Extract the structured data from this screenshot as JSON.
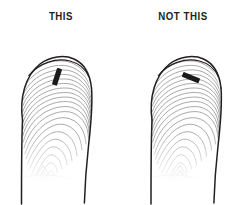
{
  "illustration": {
    "kind": "fingerprint-instruction-diagram",
    "subject": "fingertip with ink mark placement",
    "background_color": "#ffffff",
    "outline_color": "#231f20",
    "ridge_color": "#8c8c8c",
    "mark_color": "#1a1a1a",
    "label_color": "#231f20"
  },
  "panels": [
    {
      "id": "good",
      "label": "THIS",
      "is_correct": true,
      "mark": {
        "name": "ink-mark",
        "orientation": "near-vertical",
        "angle_degrees": 18,
        "position": "upper-right of fingertip pad",
        "length_px": 17,
        "width_px": 5,
        "color": "#1a1a1a"
      },
      "fingerprint": {
        "pattern": "loop-with-delta",
        "ridge_count": 22,
        "core_position": "lower-center",
        "delta_position": "bottom-center-left"
      }
    },
    {
      "id": "bad",
      "label": "NOT THIS",
      "is_correct": false,
      "mark": {
        "name": "ink-mark",
        "orientation": "diagonal",
        "angle_degrees": 112,
        "position": "upper-right of fingertip pad",
        "length_px": 18,
        "width_px": 5,
        "color": "#1a1a1a"
      },
      "fingerprint": {
        "pattern": "loop-with-delta",
        "ridge_count": 22,
        "core_position": "lower-center",
        "delta_position": "bottom-center"
      }
    }
  ]
}
